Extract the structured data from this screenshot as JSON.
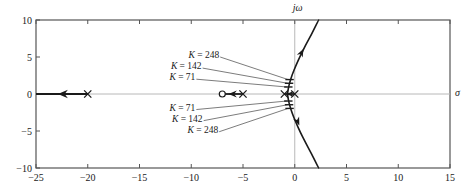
{
  "chart_data": {
    "type": "scatter",
    "title": "",
    "subtitle": "",
    "xlabel": "sigma",
    "ylabel": "j-omega",
    "xlim": [
      -25,
      15
    ],
    "ylim": [
      -10,
      10
    ],
    "grid": false,
    "legend": "none",
    "axis_labels": {
      "real_axis": "σ",
      "imag_axis": "jω"
    },
    "xticks": [
      -25,
      -20,
      -15,
      -10,
      -5,
      0,
      5,
      10,
      15
    ],
    "xticklabels": [
      "−25",
      "−20",
      "−15",
      "−10",
      "−5",
      "0",
      "5",
      "10",
      "15"
    ],
    "yticks": [
      -10,
      -5,
      0,
      5,
      10
    ],
    "yticklabels": [
      "−10",
      "−5",
      "0",
      "5",
      "10"
    ],
    "poles": [
      {
        "x": -20,
        "y": 0,
        "marker": "x"
      },
      {
        "x": -5,
        "y": 0,
        "marker": "x"
      },
      {
        "x": -1,
        "y": 0,
        "marker": "x"
      },
      {
        "x": 0,
        "y": 0,
        "marker": "x"
      }
    ],
    "zeros": [
      {
        "x": -7,
        "y": 0,
        "marker": "o"
      }
    ],
    "branch_real_left": {
      "from": [
        -20,
        0
      ],
      "to": [
        -25,
        0
      ],
      "arrow_at": [
        -22.4,
        0
      ]
    },
    "branch_real_mid": {
      "from": [
        -5,
        0
      ],
      "to": [
        -7,
        0
      ],
      "arrow_at": [
        -6.0,
        0
      ]
    },
    "branch_real_center": {
      "from": [
        -1,
        0
      ],
      "to": [
        0,
        0
      ],
      "arrow_at": [
        -0.45,
        0
      ]
    },
    "branch_upper": {
      "comment": "complex branch from breakaway near (-0.7,0) rising to upper-right",
      "points": [
        [
          -0.7,
          0.0
        ],
        [
          -0.62,
          0.8
        ],
        [
          -0.48,
          1.6
        ],
        [
          -0.25,
          2.6
        ],
        [
          0.1,
          3.8
        ],
        [
          0.55,
          5.2
        ],
        [
          1.05,
          6.6
        ],
        [
          1.6,
          8.0
        ],
        [
          2.3,
          10.0
        ]
      ],
      "arrow_at": [
        0.62,
        5.5
      ]
    },
    "branch_lower": {
      "comment": "mirror image of upper branch below the real axis",
      "points": [
        [
          -0.7,
          0.0
        ],
        [
          -0.62,
          -0.8
        ],
        [
          -0.48,
          -1.6
        ],
        [
          -0.25,
          -2.6
        ],
        [
          0.1,
          -3.8
        ],
        [
          0.55,
          -5.2
        ],
        [
          1.05,
          -6.6
        ],
        [
          1.6,
          -8.0
        ],
        [
          2.3,
          -10.0
        ]
      ],
      "arrow_at": [
        0.25,
        -3.6
      ]
    },
    "gain_markers": [
      {
        "label": "K = 248",
        "K": 248,
        "x": -0.5,
        "y": 1.95,
        "leader_to": [
          -0.45,
          1.95
        ],
        "text_anchor": [
          -7.3,
          5.0
        ]
      },
      {
        "label": "K = 142",
        "K": 142,
        "x": -0.55,
        "y": 1.45,
        "leader_to": [
          -0.5,
          1.45
        ],
        "text_anchor": [
          -9.0,
          3.5
        ]
      },
      {
        "label": "K = 71",
        "K": 71,
        "x": -0.62,
        "y": 0.95,
        "leader_to": [
          -0.58,
          0.95
        ],
        "text_anchor": [
          -9.6,
          2.0
        ]
      },
      {
        "label": "K = 71",
        "K": 71,
        "x": -0.62,
        "y": -0.95,
        "leader_to": [
          -0.58,
          -0.95
        ],
        "text_anchor": [
          -9.6,
          -2.1
        ]
      },
      {
        "label": "K = 142",
        "K": 142,
        "x": -0.55,
        "y": -1.45,
        "leader_to": [
          -0.5,
          -1.45
        ],
        "text_anchor": [
          -8.9,
          -3.6
        ]
      },
      {
        "label": "K = 248",
        "K": 248,
        "x": -0.5,
        "y": -1.95,
        "leader_to": [
          -0.45,
          -1.95
        ],
        "text_anchor": [
          -7.4,
          -5.1
        ]
      }
    ],
    "colors": {
      "locus": "#1a1a1a",
      "frame": "#555555",
      "axis_line": "#b8b8b8",
      "leader": "#5a5a5a",
      "background": "#ffffff"
    }
  }
}
